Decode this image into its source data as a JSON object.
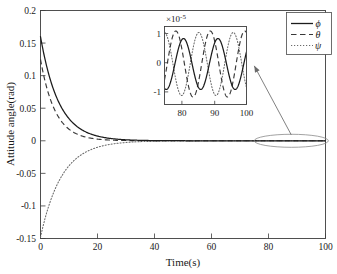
{
  "chart_data": {
    "type": "line",
    "title": "",
    "xlabel": "Time(s)",
    "ylabel": "Attitude angle(rad)",
    "xlim": [
      0,
      100
    ],
    "ylim": [
      -0.15,
      0.2
    ],
    "xticks": [
      "0",
      "20",
      "40",
      "60",
      "80",
      "100"
    ],
    "xtick_values": [
      0,
      20,
      40,
      60,
      80,
      100
    ],
    "yticks": [
      "0.2",
      "0.15",
      "0.1",
      "0.05",
      "0",
      "-0.05",
      "-0.1",
      "-0.15"
    ],
    "ytick_values": [
      0.2,
      0.15,
      0.1,
      0.05,
      0,
      -0.05,
      -0.1,
      -0.15
    ],
    "grid": false,
    "legend_position": "top-right",
    "series": [
      {
        "name": "phi",
        "label": "ϕ",
        "style": "solid",
        "color": "#1c1c1c",
        "initial_value": 0.16,
        "settling_time": 25,
        "decay_rate": 0.155,
        "x": [
          0,
          2,
          4,
          6,
          8,
          10,
          12,
          14,
          16,
          18,
          20,
          22,
          24,
          26,
          30,
          40,
          60,
          80,
          100
        ],
        "y": [
          0.16,
          0.12,
          0.09,
          0.067,
          0.05,
          0.037,
          0.027,
          0.02,
          0.014,
          0.01,
          0.007,
          0.005,
          0.003,
          0.002,
          0.001,
          0.0,
          0.0,
          0.0,
          0.0
        ]
      },
      {
        "name": "theta",
        "label": "θ",
        "style": "dashed",
        "color": "#383838",
        "initial_value": 0.125,
        "settling_time": 22,
        "decay_rate": 0.195,
        "x": [
          0,
          2,
          4,
          6,
          8,
          10,
          12,
          14,
          16,
          18,
          20,
          22,
          24,
          26,
          30,
          40,
          60,
          80,
          100
        ],
        "y": [
          0.125,
          0.085,
          0.058,
          0.039,
          0.027,
          0.018,
          0.012,
          0.008,
          0.005,
          0.003,
          0.002,
          0.001,
          0.0008,
          0.0005,
          0.0002,
          0.0,
          0.0,
          0.0,
          0.0
        ]
      },
      {
        "name": "psi",
        "label": "ψ",
        "style": "dotted",
        "color": "#6a6a6a",
        "initial_value": -0.148,
        "settling_time": 28,
        "decay_rate": 0.135,
        "x": [
          0,
          2,
          4,
          6,
          8,
          10,
          12,
          14,
          16,
          18,
          20,
          22,
          24,
          26,
          30,
          40,
          60,
          80,
          100
        ],
        "y": [
          -0.148,
          -0.113,
          -0.086,
          -0.066,
          -0.05,
          -0.038,
          -0.029,
          -0.022,
          -0.017,
          -0.013,
          -0.01,
          -0.008,
          -0.006,
          -0.004,
          -0.002,
          -0.0005,
          0.0,
          0.0,
          0.0
        ]
      }
    ],
    "inset": {
      "exponent_label": "×10",
      "exponent_sup": "-5",
      "xlim": [
        75,
        100
      ],
      "ylim": [
        -1.35,
        1.25
      ],
      "xticks": [
        "80",
        "90",
        "100"
      ],
      "xtick_values": [
        80,
        90,
        100
      ],
      "yticks": [
        "1",
        "0",
        "-1"
      ],
      "ytick_values": [
        1,
        0,
        -1
      ],
      "series": [
        {
          "name": "phi",
          "style": "solid",
          "amplitude": 0.85,
          "period": 10.5,
          "phase_deg": 200
        },
        {
          "name": "theta",
          "style": "dashed",
          "amplitude": 1.1,
          "period": 10.5,
          "phase_deg": 280
        },
        {
          "name": "psi",
          "style": "dotted",
          "amplitude": 1.05,
          "period": 10.5,
          "phase_deg": 40
        }
      ]
    },
    "annotations": [
      {
        "type": "ellipse",
        "name": "zoom-region-ellipse",
        "center_x": 88,
        "center_y": 0.0,
        "width_x": 26,
        "height_y": 0.02
      },
      {
        "type": "arrow",
        "name": "zoom-callout-arrow",
        "from_x": 88,
        "from_y": 0.009,
        "to_x": 75,
        "to_y": 0.115
      }
    ]
  },
  "legend": {
    "entries": [
      {
        "label": "ϕ",
        "style": "solid"
      },
      {
        "label": "θ",
        "style": "dashed"
      },
      {
        "label": "ψ",
        "style": "dotted"
      }
    ]
  }
}
